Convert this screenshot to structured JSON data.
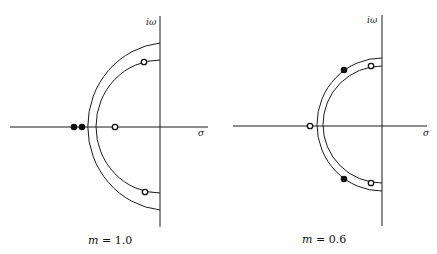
{
  "diagrams": [
    {
      "caption_var": "m",
      "caption_eq": " = ",
      "caption_val": "1.0",
      "axis_y_label": "iω",
      "axis_x_label": "σ",
      "zeros": [
        "open circle near upper inner arc",
        "open circle on real axis",
        "open circle near lower inner arc"
      ],
      "poles": [
        "two filled dots on real axis left of outer arc"
      ]
    },
    {
      "caption_var": "m",
      "caption_eq": " = ",
      "caption_val": "0.6",
      "axis_y_label": "iω",
      "axis_x_label": "σ",
      "zeros": [
        "open circle near upper inner arc",
        "open circle on real axis left of arcs",
        "open circle near lower inner arc"
      ],
      "poles": [
        "filled dot on upper outer arc",
        "filled dot on lower outer arc"
      ]
    }
  ],
  "colors": {
    "ink": "#1a1a1a",
    "background": "#ffffff"
  }
}
